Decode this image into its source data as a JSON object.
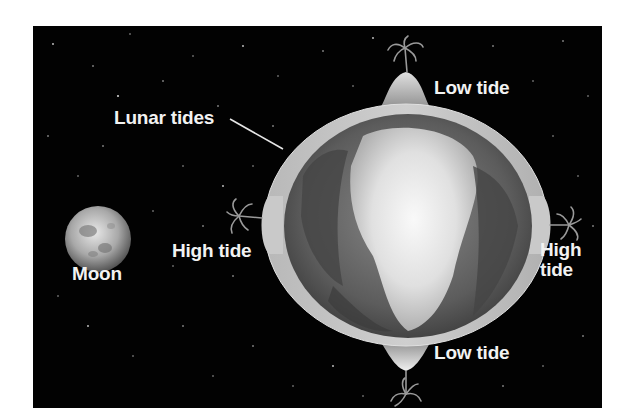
{
  "diagram": {
    "title": "Lunar tides",
    "background_color": "#020202",
    "text_color": "#f2f2f2",
    "labels": {
      "lunar_tides": "Lunar tides",
      "moon": "Moon",
      "low_tide_top": "Low tide",
      "low_tide_bottom": "Low tide",
      "high_tide_left": "High tide",
      "high_tide_right_line1": "High",
      "high_tide_right_line2": "tide"
    },
    "bodies": [
      {
        "name": "Moon",
        "shape": "circle"
      },
      {
        "name": "Earth",
        "shape": "ellipse",
        "feature": "tidal water bulges"
      }
    ],
    "icons": [
      "palm-tree-top",
      "palm-tree-left",
      "palm-tree-right",
      "palm-tree-bottom"
    ]
  }
}
